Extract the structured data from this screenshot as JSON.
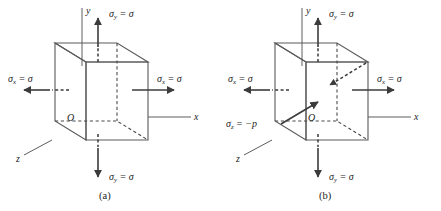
{
  "figure": {
    "background_color": "#ffffff",
    "panels": [
      {
        "id": "panel-a",
        "caption": "(a)",
        "axes": {
          "y_label": "y",
          "x_label": "x",
          "z_label": "z",
          "origin_label": "O"
        },
        "stress_labels": {
          "sigma_y_top": "σ",
          "sigma_y_top_sub": "y",
          "sigma_y_top_eq": " = σ",
          "sigma_y_bottom": "σ",
          "sigma_y_bottom_sub": "y",
          "sigma_y_bottom_eq": " = σ",
          "sigma_x_left": "σ",
          "sigma_x_left_sub": "x",
          "sigma_x_left_eq": " = σ",
          "sigma_x_right": "σ",
          "sigma_x_right_sub": "x",
          "sigma_x_right_eq": " = σ"
        },
        "colors": {
          "top_face": "#e6e6e3",
          "front_face": "#d4d4d1",
          "right_face": "#c4c4c1",
          "edge": "#5a5a5a",
          "arrow": "#3b3b3b"
        }
      },
      {
        "id": "panel-b",
        "caption": "(b)",
        "axes": {
          "y_label": "y",
          "x_label": "x",
          "z_label": "z",
          "origin_label": "O"
        },
        "stress_labels": {
          "sigma_y_top": "σ",
          "sigma_y_top_sub": "y",
          "sigma_y_top_eq": " = σ",
          "sigma_y_bottom": "σ",
          "sigma_y_bottom_sub": "y",
          "sigma_y_bottom_eq": " = σ",
          "sigma_x_left": "σ",
          "sigma_x_left_sub": "x",
          "sigma_x_left_eq": " = σ",
          "sigma_x_right": "σ",
          "sigma_x_right_sub": "x",
          "sigma_x_right_eq": " = σ",
          "sigma_z": "σ",
          "sigma_z_sub": "z",
          "sigma_z_eq": " = −p"
        },
        "colors": {
          "top_face": "#e6e6e3",
          "front_face": "#d4d4d1",
          "right_face": "#c4c4c1",
          "edge": "#5a5a5a",
          "arrow": "#3b3b3b"
        }
      }
    ]
  }
}
